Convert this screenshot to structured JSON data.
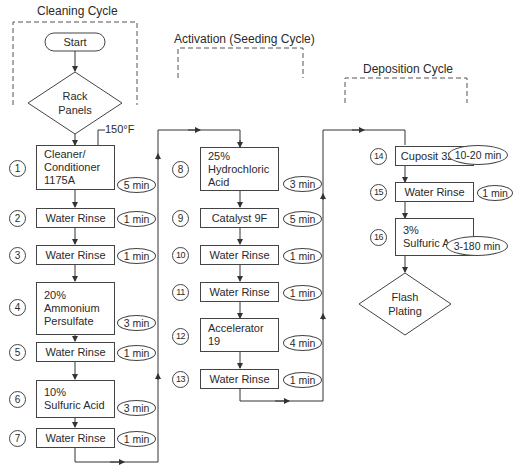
{
  "cycles": {
    "cleaning": "Cleaning Cycle",
    "activation": "Activation (Seeding Cycle)",
    "deposition": "Deposition Cycle"
  },
  "start_label": "Start",
  "rack_label": "Rack\nPanels",
  "temperature_note": "150°F",
  "end_label": "Flash\nPlating",
  "steps": [
    {
      "num": "1",
      "name": "Cleaner/\nConditioner\n1175A",
      "time": "5 min"
    },
    {
      "num": "2",
      "name": "Water Rinse",
      "time": "1 min"
    },
    {
      "num": "3",
      "name": "Water Rinse",
      "time": "1 min"
    },
    {
      "num": "4",
      "name": "20%\nAmmonium\nPersulfate",
      "time": "3 min"
    },
    {
      "num": "5",
      "name": "Water Rinse",
      "time": "1 min"
    },
    {
      "num": "6",
      "name": "10%\nSulfuric Acid",
      "time": "3 min"
    },
    {
      "num": "7",
      "name": "Water Rinse",
      "time": "1 min"
    },
    {
      "num": "8",
      "name": "25%\nHydrochloric\nAcid",
      "time": "3 min"
    },
    {
      "num": "9",
      "name": "Catalyst 9F",
      "time": "5 min"
    },
    {
      "num": "10",
      "name": "Water Rinse",
      "time": "1 min"
    },
    {
      "num": "11",
      "name": "Water Rinse",
      "time": "1 min"
    },
    {
      "num": "12",
      "name": "Accelerator\n19",
      "time": "4 min"
    },
    {
      "num": "13",
      "name": "Water Rinse",
      "time": "1 min"
    },
    {
      "num": "14",
      "name": "Cuposit 328Q",
      "time": "10-20 min"
    },
    {
      "num": "15",
      "name": "Water Rinse",
      "time": "1 min"
    },
    {
      "num": "16",
      "name": "3%\nSulfuric Acid",
      "time": "3-180 min"
    }
  ],
  "colors": {
    "line": "#444444",
    "text": "#2a2a2a",
    "background": "#ffffff"
  }
}
